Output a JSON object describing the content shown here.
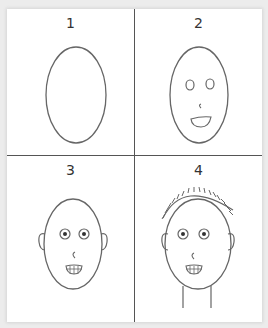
{
  "steps": [
    {
      "label": "1",
      "description": "egg-shaped head outline"
    },
    {
      "label": "2",
      "description": "add eyes, nose and smiling mouth"
    },
    {
      "label": "3",
      "description": "add ears, pupils and teeth"
    },
    {
      "label": "4",
      "description": "add stitched hair and neck"
    }
  ],
  "colors": {
    "line": "#555555",
    "background": "#ffffff",
    "page": "#ececec"
  }
}
